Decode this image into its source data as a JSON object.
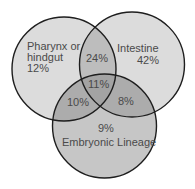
{
  "diagram": {
    "type": "venn",
    "sets": [
      {
        "id": "pharynx",
        "label_line1": "Pharynx or",
        "label_line2": "hindgut",
        "only_value": "12%",
        "cx": 64,
        "cy": 69,
        "r": 52
      },
      {
        "id": "intestine",
        "label": "Intestine",
        "only_value": "42%",
        "cx": 132,
        "cy": 64.5,
        "r": 52.5
      },
      {
        "id": "embryonic",
        "label": "Embryonic Lineage",
        "only_value": "9%",
        "cx": 104.5,
        "cy": 126,
        "r": 52
      }
    ],
    "intersections": {
      "pharynx_intestine": "24%",
      "pharynx_embryonic": "10%",
      "intestine_embryonic": "8%",
      "all_three": "11%"
    },
    "colors": {
      "single_region": "#dcdcdc",
      "embryonic_region": "#c6c6c6",
      "outline": "#1e1e1e",
      "text": "#4a4a4a"
    }
  }
}
